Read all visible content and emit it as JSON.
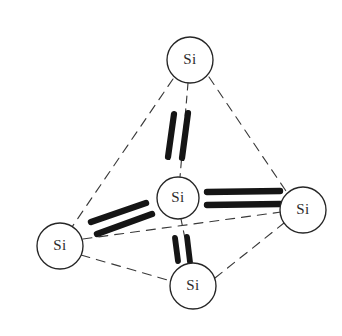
{
  "figure": {
    "name": "silicon-tetrahedron-bonding-diagram",
    "background_color": "#ffffff",
    "line_color": "#3a3a3a",
    "bond_color": "#151515",
    "atom_outline_color": "#262626",
    "atom_fill_color": "#ffffff",
    "label_color": "#2b2b2b",
    "width": 342,
    "height": 336
  },
  "atoms": [
    {
      "id": "si-top",
      "label": "Si",
      "cx": 190,
      "cy": 60,
      "r": 23
    },
    {
      "id": "si-left",
      "label": "Si",
      "cx": 60,
      "cy": 246,
      "r": 23
    },
    {
      "id": "si-right",
      "label": "Si",
      "cx": 303,
      "cy": 210,
      "r": 23
    },
    {
      "id": "si-bottom",
      "label": "Si",
      "cx": 193,
      "cy": 286,
      "r": 23
    },
    {
      "id": "si-center",
      "label": "Si",
      "cx": 178,
      "cy": 198,
      "r": 21
    }
  ],
  "edges": [
    {
      "id": "edge-top-left",
      "from": "si-top",
      "to": "si-left",
      "style": "dashed"
    },
    {
      "id": "edge-top-right",
      "from": "si-top",
      "to": "si-right",
      "style": "dashed"
    },
    {
      "id": "edge-top-center",
      "from": "si-top",
      "to": "si-center",
      "style": "dashed"
    },
    {
      "id": "edge-left-bottom",
      "from": "si-left",
      "to": "si-bottom",
      "style": "dashed"
    },
    {
      "id": "edge-bottom-right",
      "from": "si-bottom",
      "to": "si-right",
      "style": "dashed"
    },
    {
      "id": "edge-left-right",
      "from": "si-left",
      "to": "si-right",
      "style": "dashed"
    },
    {
      "id": "edge-center-bottom",
      "from": "si-center",
      "to": "si-bottom",
      "style": "dashed"
    }
  ],
  "bonds": [
    {
      "id": "bond-center-top",
      "between": [
        "si-center",
        "si-top"
      ],
      "orientation": "vertical",
      "electron_pair_count": 2
    },
    {
      "id": "bond-center-left",
      "between": [
        "si-center",
        "si-left"
      ],
      "orientation": "diagonal-up-right",
      "electron_pair_count": 2
    },
    {
      "id": "bond-center-right",
      "between": [
        "si-center",
        "si-right"
      ],
      "orientation": "horizontal",
      "electron_pair_count": 2
    },
    {
      "id": "bond-center-bottom",
      "between": [
        "si-center",
        "si-bottom"
      ],
      "orientation": "vertical",
      "electron_pair_count": 2
    }
  ],
  "labels": {
    "si_top": "Si",
    "si_left": "Si",
    "si_right": "Si",
    "si_bottom": "Si",
    "si_center": "Si"
  }
}
